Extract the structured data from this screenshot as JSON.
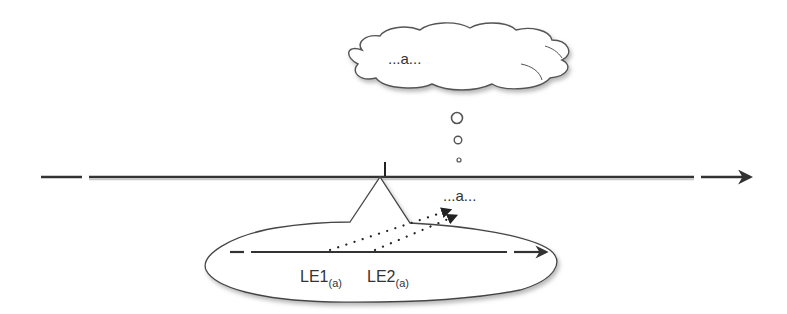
{
  "diagram": {
    "cloud": {
      "text": "...a..."
    },
    "main_line": {
      "direction": "right",
      "style": "broken-start-and-end"
    },
    "emerging_label": {
      "text": "...a..."
    },
    "ellipse": {
      "inner_line": {
        "direction": "right"
      },
      "labels": [
        {
          "main": "LE1",
          "sub": "(a)"
        },
        {
          "main": "LE2",
          "sub": "(a)"
        }
      ]
    },
    "colors": {
      "stroke": "#333333",
      "background": "#ffffff",
      "shadow": "#bdbdbd"
    }
  }
}
